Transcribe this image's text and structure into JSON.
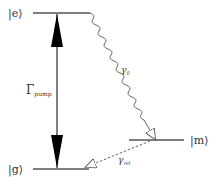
{
  "diagram": {
    "type": "energy-level-diagram",
    "levels": [
      {
        "id": "e",
        "label": "|e⟩",
        "ket_letter": "e"
      },
      {
        "id": "m",
        "label": "|m⟩",
        "ket_letter": "m"
      },
      {
        "id": "g",
        "label": "|g⟩",
        "ket_letter": "g"
      }
    ],
    "transitions": [
      {
        "id": "pump",
        "from": "g",
        "to": "e",
        "style": "solid-bidirectional-filled-arrows",
        "label": "Γ",
        "label_sub": "pump"
      },
      {
        "id": "decay0",
        "from": "e",
        "to": "m",
        "style": "wavy-open-arrow",
        "label": "γ",
        "label_sub": "0"
      },
      {
        "id": "relax",
        "from": "m",
        "to": "g",
        "style": "dashed-open-arrow",
        "label": "γ",
        "label_sub": "rel"
      }
    ],
    "colors": {
      "line": "#555555",
      "arrow_fill": "#000000",
      "text": "#333333"
    }
  }
}
